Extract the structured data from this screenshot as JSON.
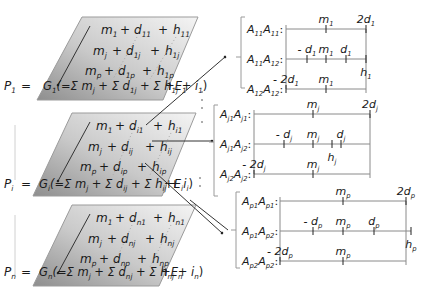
{
  "planes": [
    {
      "id": "1",
      "lhs": "P",
      "lhs_sub": "1",
      "rows": [
        {
          "m": "m",
          "m_sub": "1",
          "d": "d",
          "d_sub": "11",
          "h": "h",
          "h_sub": "11"
        },
        {
          "m": "m",
          "m_sub": "j",
          "d": "d",
          "d_sub": "1j",
          "h": "h",
          "h_sub": "1j"
        },
        {
          "m": "m",
          "m_sub": "p",
          "d": "d",
          "d_sub": "1p",
          "h": "h",
          "h_sub": "1p"
        }
      ],
      "formula": {
        "G": "G",
        "G_sub": "1",
        "body": "(=Σ m",
        "body_sub": "j",
        "p2": " + Σ d",
        "p2_sub": "1j",
        "p3": " + Σ h",
        "p3_sub": "1j",
        "p4": " + i",
        "p4_sub": "1",
        "close": ")",
        "E": "+E",
        "E_sub": "1"
      }
    },
    {
      "id": "i",
      "lhs": "P",
      "lhs_sub": "i",
      "rows": [
        {
          "m": "m",
          "m_sub": "1",
          "d": "d",
          "d_sub": "i1",
          "h": "h",
          "h_sub": "i1"
        },
        {
          "m": "m",
          "m_sub": "j",
          "d": "d",
          "d_sub": "ij",
          "h": "h",
          "h_sub": "ij"
        },
        {
          "m": "m",
          "m_sub": "p",
          "d": "d",
          "d_sub": "ip",
          "h": "h",
          "h_sub": "ip"
        }
      ],
      "formula": {
        "G": "G",
        "G_sub": "i",
        "body": "(=Σ m",
        "body_sub": "j",
        "p2": " + Σ d",
        "p2_sub": "ij",
        "p3": " + Σ h",
        "p3_sub": "ij",
        "p4": " + i",
        "p4_sub": "i",
        "close": ")",
        "E": "+E",
        "E_sub": "i"
      }
    },
    {
      "id": "n",
      "lhs": "P",
      "lhs_sub": "n",
      "rows": [
        {
          "m": "m",
          "m_sub": "1",
          "d": "d",
          "d_sub": "n1",
          "h": "h",
          "h_sub": "n1"
        },
        {
          "m": "m",
          "m_sub": "j",
          "d": "d",
          "d_sub": "nj",
          "h": "h",
          "h_sub": "nj"
        },
        {
          "m": "m",
          "m_sub": "p",
          "d": "d",
          "d_sub": "np",
          "h": "h",
          "h_sub": "np"
        }
      ],
      "formula": {
        "G": "G",
        "G_sub": "n",
        "body": "(=Σ m",
        "body_sub": "j",
        "p2": " + Σ d",
        "p2_sub": "nj",
        "p3": " + Σ h",
        "p3_sub": "nj",
        "p4": " + i",
        "p4_sub": "n",
        "close": ")",
        "E": "+E",
        "E_sub": "n"
      }
    }
  ],
  "panels": [
    {
      "id": "1",
      "rows": [
        {
          "label_a": "A",
          "label_a_sub": "11",
          "label_b": "A",
          "label_b_sub": "11",
          "colon": ":"
        },
        {
          "label_a": "A",
          "label_a_sub": "11",
          "label_b": "A",
          "label_b_sub": "12",
          "colon": ":"
        },
        {
          "label_a": "A",
          "label_a_sub": "12",
          "label_b": "A",
          "label_b_sub": "12",
          "colon": ":"
        }
      ],
      "ticks": {
        "row1": [
          {
            "label": "m",
            "sub": "1",
            "pos": "m"
          },
          {
            "label": "2d",
            "sub": "1",
            "pos": "+2d"
          }
        ],
        "row2": [
          {
            "label": "- d",
            "sub": "1",
            "pos": "-d"
          },
          {
            "label": "m",
            "sub": "1",
            "pos": "m"
          },
          {
            "label": "d",
            "sub": "1",
            "pos": "+d"
          },
          {
            "label": "h",
            "sub": "1",
            "pos": "h",
            "below": true
          }
        ],
        "row3": [
          {
            "label": "- 2d",
            "sub": "1",
            "pos": "-2d"
          },
          {
            "label": "m",
            "sub": "1",
            "pos": "m"
          }
        ]
      }
    },
    {
      "id": "j",
      "rows": [
        {
          "label_a": "A",
          "label_a_sub": "j1",
          "label_b": "A",
          "label_b_sub": "j1",
          "colon": ":"
        },
        {
          "label_a": "A",
          "label_a_sub": "j1",
          "label_b": "A",
          "label_b_sub": "j2",
          "colon": ":"
        },
        {
          "label_a": "A",
          "label_a_sub": "j2",
          "label_b": "A",
          "label_b_sub": "j2",
          "colon": ":"
        }
      ],
      "ticks": {
        "row1": [
          {
            "label": "m",
            "sub": "j",
            "pos": "m"
          },
          {
            "label": "2d",
            "sub": "j",
            "pos": "+2d"
          }
        ],
        "row2": [
          {
            "label": "- d",
            "sub": "j",
            "pos": "-d"
          },
          {
            "label": "m",
            "sub": "j",
            "pos": "m"
          },
          {
            "label": "h",
            "sub": "j",
            "pos": "h",
            "below": true
          },
          {
            "label": "d",
            "sub": "j",
            "pos": "+d"
          }
        ],
        "row3": [
          {
            "label": "- 2d",
            "sub": "j",
            "pos": "-2d"
          },
          {
            "label": "m",
            "sub": "j",
            "pos": "m"
          }
        ]
      }
    },
    {
      "id": "p",
      "rows": [
        {
          "label_a": "A",
          "label_a_sub": "p1",
          "label_b": "A",
          "label_b_sub": "p1",
          "colon": ":"
        },
        {
          "label_a": "A",
          "label_a_sub": "p1",
          "label_b": "A",
          "label_b_sub": "p2",
          "colon": ":"
        },
        {
          "label_a": "A",
          "label_a_sub": "p2",
          "label_b": "A",
          "label_b_sub": "p2",
          "colon": ":"
        }
      ],
      "ticks": {
        "row1": [
          {
            "label": "m",
            "sub": "p",
            "pos": "m"
          },
          {
            "label": "2d",
            "sub": "p",
            "pos": "+2d"
          }
        ],
        "row2": [
          {
            "label": "- d",
            "sub": "p",
            "pos": "-d"
          },
          {
            "label": "m",
            "sub": "p",
            "pos": "m"
          },
          {
            "label": "d",
            "sub": "p",
            "pos": "+d"
          },
          {
            "label": "h",
            "sub": "p",
            "pos": "h",
            "below": true
          }
        ],
        "row3": [
          {
            "label": "- 2d",
            "sub": "p",
            "pos": "-2d"
          },
          {
            "label": "m",
            "sub": "p",
            "pos": "m"
          }
        ]
      }
    }
  ],
  "operators": {
    "plus": "+",
    "equals": "="
  }
}
